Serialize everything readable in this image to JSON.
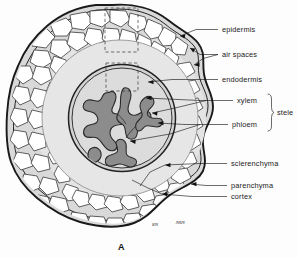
{
  "figure": {
    "caption": "A",
    "signature_left": "ʁɴ",
    "signature_right": "ɴʀɴ"
  },
  "colors": {
    "epidermis_outline": "#1a1a1a",
    "cortex_fill": "#d9d9d9",
    "inner_cortex_fill": "#e3e3e3",
    "stele_fill": "#d0d0d0",
    "xylem_fill": "#8c8c8c",
    "cell_fill": "#ffffff",
    "cell_wall": "#2e2e2e",
    "leader_line": "#111111",
    "text": "#1a1a1a",
    "background": "#fdfdfd"
  },
  "labels": [
    {
      "id": "epidermis",
      "text": "epidermis",
      "text_x": 222,
      "text_y": 32,
      "leader": "M218,29.5 L196,29.5 L178,36",
      "arrow_at": [
        178,
        36
      ],
      "arrow_angle": 160
    },
    {
      "id": "air-spaces",
      "text": "air spaces",
      "text_x": 222,
      "text_y": 57,
      "leader": "M218,54.5 L200,54.5 L190,48 M218,54.5 L202,58 L194,64",
      "arrow_at": [
        190,
        48
      ],
      "arrow_angle": 215
    },
    {
      "id": "endodermis",
      "text": "endodermis",
      "text_x": 222,
      "text_y": 82,
      "leader": "M218,79.5 L170,79.5 L147,82",
      "arrow_at": [
        147,
        82
      ],
      "arrow_angle": 186
    },
    {
      "id": "xylem",
      "text": "xylem",
      "text_x": 237,
      "text_y": 103,
      "leader": "M233,100.5 L190,100.5 L144,98",
      "arrow_at": [
        144,
        98
      ],
      "arrow_angle": 183
    },
    {
      "id": "phloem",
      "text": "phloem",
      "text_x": 232,
      "text_y": 127,
      "leader": "M228,124.5 L180,124.5 L156,123",
      "arrow_at": [
        156,
        123
      ],
      "arrow_angle": 184
    },
    {
      "id": "sclerenchyma",
      "text": "sclerenchyma",
      "text_x": 231,
      "text_y": 166,
      "leader": "M227,163.5 L200,163.5 L163,165",
      "arrow_at": [
        163,
        165
      ],
      "arrow_angle": 178
    },
    {
      "id": "parenchyma",
      "text": "parenchyma",
      "text_x": 231,
      "text_y": 188,
      "leader": "M227,185.5 L205,185.5 L189,184",
      "arrow_at": [
        189,
        184
      ],
      "arrow_angle": 185
    },
    {
      "id": "cortex",
      "text": "cortex",
      "text_x": 231,
      "text_y": 199,
      "leader": "M227,196.5 L190,196.5 L160,194",
      "arrow_at": [
        160,
        194
      ],
      "arrow_angle": 184
    }
  ],
  "bracket_label": {
    "id": "stele",
    "text": "stele",
    "text_x": 277,
    "text_y": 115,
    "path": "M268,94 Q271.5,94 271.5,99 L271.5,108 Q271.5,112.5 274,112.5 Q271.5,112.5 271.5,117 L271.5,126 Q271.5,131 268,131"
  },
  "extra_leaders": [
    {
      "id": "xylem-secondary",
      "path": "M206,100.5 L170,108 L150,112",
      "arrow_at": [
        150,
        112
      ],
      "arrow_angle": 190
    },
    {
      "id": "phloem-secondary",
      "path": "M196,124.5 L170,134 L128,140",
      "arrow_at": [
        128,
        140
      ],
      "arrow_angle": 188
    }
  ],
  "dashed_boxes": [
    {
      "id": "epidermis-detail-box",
      "x": 105,
      "y": 8,
      "width": 33,
      "height": 44
    },
    {
      "id": "stele-detail-box",
      "x": 106,
      "y": 63,
      "width": 32,
      "height": 28
    }
  ],
  "regions": [
    {
      "id": "epidermis",
      "name": "epidermis",
      "role": "outer protective layer"
    },
    {
      "id": "cortex",
      "name": "cortex",
      "role": "parenchyma storage ground tissue"
    },
    {
      "id": "air-spaces",
      "name": "air spaces",
      "role": "intercellular gaps in cortex"
    },
    {
      "id": "endodermis",
      "name": "endodermis",
      "role": "inner boundary of cortex"
    },
    {
      "id": "stele",
      "name": "stele",
      "role": "vascular cylinder"
    },
    {
      "id": "xylem",
      "name": "xylem",
      "role": "water conducting tissue"
    },
    {
      "id": "phloem",
      "name": "phloem",
      "role": "food conducting tissue"
    },
    {
      "id": "sclerenchyma",
      "name": "sclerenchyma",
      "role": "support tissue"
    },
    {
      "id": "parenchyma",
      "name": "parenchyma",
      "role": "ground tissue"
    }
  ]
}
